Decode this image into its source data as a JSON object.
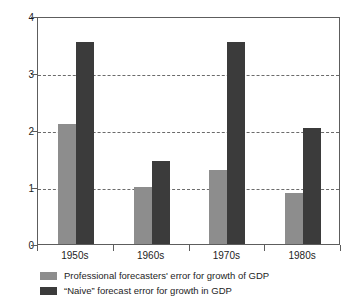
{
  "chart_data": {
    "type": "bar",
    "title": "",
    "xlabel": "",
    "ylabel": "Forecast error (percent per year)",
    "categories": [
      "1950s",
      "1960s",
      "1970s",
      "1980s"
    ],
    "series": [
      {
        "name": "Professional forecasters' error for growth of GDP",
        "color": "#8d8d8d",
        "values": [
          2.1,
          1.0,
          1.3,
          0.9
        ]
      },
      {
        "name": "“Naive” forecast error for growth in GDP",
        "color": "#3b3b3b",
        "values": [
          3.55,
          1.45,
          3.55,
          2.03
        ]
      }
    ],
    "ylim": [
      0,
      4
    ],
    "yticks": [
      "0",
      "1",
      "2",
      "3",
      "4"
    ],
    "ytick_values": [
      0,
      1,
      2,
      3,
      4
    ],
    "gridlines": [
      1,
      2,
      3
    ],
    "grid": true,
    "legend_position": "bottom-left"
  }
}
